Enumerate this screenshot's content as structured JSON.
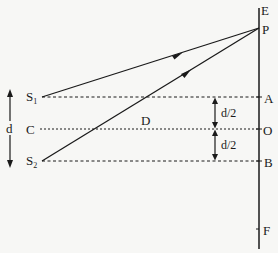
{
  "diagram": {
    "type": "double-slit geometry",
    "labels": {
      "E": "E",
      "P": "P",
      "S1": "S",
      "S1_sub": "1",
      "S2": "S",
      "S2_sub": "2",
      "C": "C",
      "D": "D",
      "A": "A",
      "O": "O",
      "B": "B",
      "F": "F",
      "d": "d",
      "half_d_top": "d/2",
      "half_d_bottom": "d/2"
    },
    "colors": {
      "ink": "#1a1a1a",
      "background": "#f7f7f5"
    }
  }
}
